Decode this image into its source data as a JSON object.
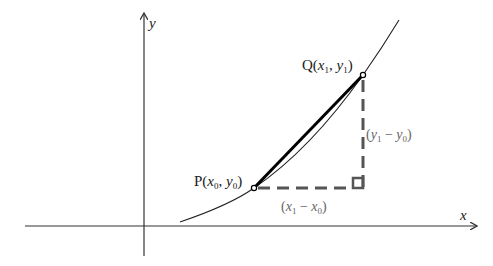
{
  "diagram": {
    "type": "secant-slope",
    "axes": {
      "x_label": "x",
      "y_label": "y"
    },
    "points": [
      {
        "name": "P",
        "label": "P",
        "coord_x": "x",
        "coord_x_sub": "0",
        "coord_y": "y",
        "coord_y_sub": "0"
      },
      {
        "name": "Q",
        "label": "Q",
        "coord_x": "x",
        "coord_x_sub": "1",
        "coord_y": "y",
        "coord_y_sub": "1"
      }
    ],
    "run_label": {
      "open": "(",
      "a": "x",
      "a_sub": "1",
      "op": " − ",
      "b": "x",
      "b_sub": "0",
      "close": ")"
    },
    "rise_label": {
      "open": "(",
      "a": "y",
      "a_sub": "1",
      "op": " − ",
      "b": "y",
      "b_sub": "0",
      "close": ")"
    },
    "colors": {
      "axis": "#333333",
      "curve": "#222222",
      "secant": "#000000",
      "dashed": "#555555",
      "label_grey": "#666666"
    }
  }
}
